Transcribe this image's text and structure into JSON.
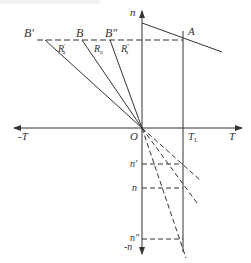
{
  "diagram": {
    "title": "",
    "colors": {
      "line": "#333333",
      "background": "#ffffff"
    },
    "axes": {
      "horizontal": {
        "positive_label": "T",
        "negative_label": "-T"
      },
      "vertical": {
        "positive_label": "n",
        "negative_label": "-n"
      },
      "origin_label": "O"
    },
    "points": {
      "A": "A",
      "B_prime": "B′",
      "B": "B",
      "B_double_prime": "B″",
      "T_L": {
        "main": "T",
        "sub": "L"
      }
    },
    "resistor_labels": [
      {
        "main": "R",
        "sub": "a",
        "prime": "′"
      },
      {
        "main": "R",
        "sub": "a",
        "prime": ""
      },
      {
        "main": "R",
        "sub": "a",
        "prime": "″"
      }
    ],
    "speed_levels": {
      "n_prime": "n′",
      "n": "n",
      "n_double_prime": "n″"
    }
  }
}
